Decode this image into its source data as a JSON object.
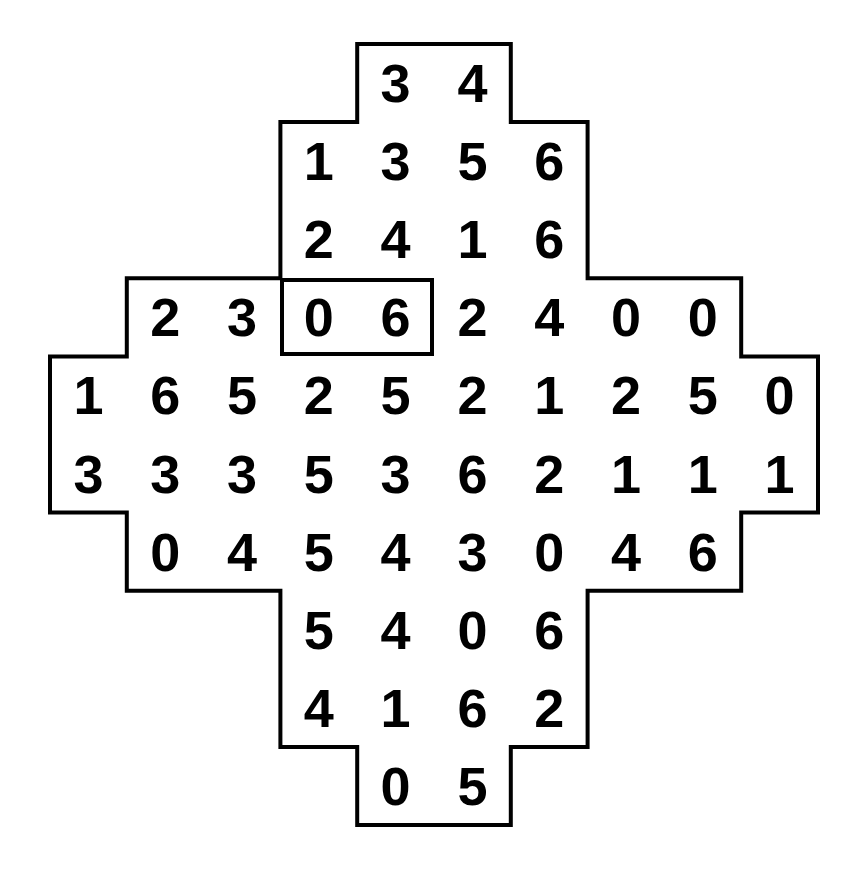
{
  "figure": {
    "kind": "number-grid-puzzle",
    "shape": "cross-diamond-polyomino",
    "background_color": "#ffffff",
    "outline_color": "#000000",
    "digit_color": "#000000",
    "outline_width_px": 4,
    "columns": 10,
    "rows": 10,
    "cell_width_px": 76.8,
    "cell_height_px": 78.1,
    "origin_x_px": 50,
    "origin_y_px": 44
  },
  "grid": {
    "rows": [
      {
        "index": 0,
        "start_col": 4,
        "values": [
          "3",
          "4"
        ]
      },
      {
        "index": 1,
        "start_col": 3,
        "values": [
          "1",
          "3",
          "5",
          "6"
        ]
      },
      {
        "index": 2,
        "start_col": 3,
        "values": [
          "2",
          "4",
          "1",
          "6"
        ]
      },
      {
        "index": 3,
        "start_col": 1,
        "values": [
          "2",
          "3",
          "0",
          "6",
          "2",
          "4",
          "0",
          "0"
        ]
      },
      {
        "index": 4,
        "start_col": 0,
        "values": [
          "1",
          "6",
          "5",
          "2",
          "5",
          "2",
          "1",
          "2",
          "5",
          "0"
        ]
      },
      {
        "index": 5,
        "start_col": 0,
        "values": [
          "3",
          "3",
          "3",
          "5",
          "3",
          "6",
          "2",
          "1",
          "1",
          "1"
        ]
      },
      {
        "index": 6,
        "start_col": 1,
        "values": [
          "0",
          "4",
          "5",
          "4",
          "3",
          "0",
          "4",
          "6"
        ]
      },
      {
        "index": 7,
        "start_col": 3,
        "values": [
          "5",
          "4",
          "0",
          "6"
        ]
      },
      {
        "index": 8,
        "start_col": 3,
        "values": [
          "4",
          "1",
          "6",
          "2"
        ]
      },
      {
        "index": 9,
        "start_col": 4,
        "values": [
          "0",
          "5"
        ]
      }
    ]
  },
  "selection": {
    "label": "highlighted-pair",
    "row": 3,
    "start_col": 3,
    "end_col": 4,
    "values": [
      "0",
      "6"
    ],
    "border_color": "#000000",
    "border_width_px": 4
  }
}
